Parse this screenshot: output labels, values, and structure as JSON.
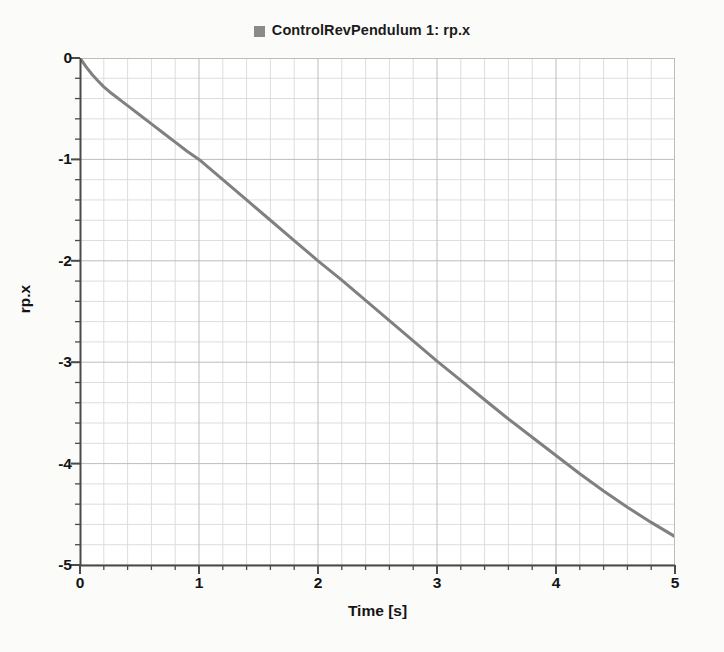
{
  "legend": {
    "entries": [
      {
        "label": "ControlRevPendulum 1: rp.x",
        "color": "#8a8a8a",
        "marker": "square"
      }
    ]
  },
  "axes": {
    "x_title": "Time [s]",
    "y_title": "rp.x",
    "x_ticks": [
      "0",
      "1",
      "2",
      "3",
      "4",
      "5"
    ],
    "y_ticks": [
      "0",
      "-1",
      "-2",
      "-3",
      "-4",
      "-5"
    ]
  },
  "chart_data": {
    "type": "line",
    "title": "",
    "subtitle": "",
    "xlabel": "Time [s]",
    "ylabel": "rp.x",
    "xlim": [
      0,
      5
    ],
    "ylim": [
      -5,
      0
    ],
    "grid": true,
    "grid_major_step_x": 1,
    "grid_minor_step_x": 0.2,
    "grid_major_step_y": 1,
    "grid_minor_step_y": 0.2,
    "legend_position": "top-center",
    "x_tick_labels": [
      "0",
      "1",
      "2",
      "3",
      "4",
      "5"
    ],
    "y_tick_labels": [
      "0",
      "-1",
      "-2",
      "-3",
      "-4",
      "-5"
    ],
    "series": [
      {
        "name": "ControlRevPendulum 1: rp.x",
        "color": "#808080",
        "line_width": 3,
        "x": [
          0,
          0.05,
          0.1,
          0.15,
          0.2,
          0.25,
          0.3,
          0.35,
          0.4,
          0.5,
          0.6,
          0.7,
          0.8,
          0.9,
          1.0,
          1.2,
          1.4,
          1.6,
          1.8,
          2.0,
          2.2,
          2.4,
          2.6,
          2.8,
          3.0,
          3.2,
          3.4,
          3.6,
          3.8,
          4.0,
          4.2,
          4.4,
          4.6,
          4.8,
          5.0
        ],
        "y": [
          0.0,
          -0.085,
          -0.16,
          -0.225,
          -0.285,
          -0.335,
          -0.38,
          -0.425,
          -0.47,
          -0.56,
          -0.65,
          -0.74,
          -0.83,
          -0.92,
          -1.0,
          -1.2,
          -1.4,
          -1.6,
          -1.8,
          -2.0,
          -2.19,
          -2.39,
          -2.59,
          -2.79,
          -2.99,
          -3.18,
          -3.37,
          -3.56,
          -3.74,
          -3.92,
          -4.1,
          -4.27,
          -4.43,
          -4.58,
          -4.72
        ]
      }
    ],
    "annotations": []
  },
  "colors": {
    "page_background": "#fbfbf9",
    "plot_background": "#ffffff",
    "grid_minor": "#dddddd",
    "grid_major": "#bdbdbd",
    "axis": "#4a4a4a",
    "series": "#808080",
    "text": "#141414"
  }
}
